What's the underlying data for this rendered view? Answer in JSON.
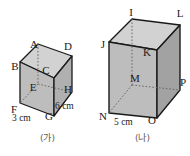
{
  "sheet": {
    "title": "two-cuboid-geometry-figure",
    "background": "#ffffff",
    "width": 190,
    "height": 156
  },
  "style": {
    "edge_color": "#1a1a1a",
    "hidden_edge_color": "#6a6a6a",
    "front_face_fill": "#bdbdbd",
    "side_face_fill": "#a6a6a6",
    "top_face_fill": "#d2d2d2",
    "label_color": "#1a1a1a",
    "caption_color": "#5a5a5a"
  },
  "figures": [
    {
      "id": "figure-a",
      "caption": "(가)",
      "vertices": [
        {
          "name": "A",
          "label": "A",
          "x": 34,
          "y": 48,
          "anchor": "middle",
          "hidden": true
        },
        {
          "name": "B",
          "label": "B",
          "x": 15,
          "y": 70,
          "anchor": "middle",
          "hidden": false
        },
        {
          "name": "C",
          "label": "C",
          "x": 46,
          "y": 74,
          "anchor": "middle",
          "hidden": false
        },
        {
          "name": "D",
          "label": "D",
          "x": 68,
          "y": 50,
          "anchor": "middle",
          "hidden": false
        },
        {
          "name": "E",
          "label": "E",
          "x": 33,
          "y": 91,
          "anchor": "middle",
          "hidden": true
        },
        {
          "name": "F",
          "label": "F",
          "x": 14,
          "y": 113,
          "anchor": "middle",
          "hidden": false
        },
        {
          "name": "G",
          "label": "G",
          "x": 49,
          "y": 120,
          "anchor": "middle",
          "hidden": false
        },
        {
          "name": "H",
          "label": "H",
          "x": 68,
          "y": 93,
          "anchor": "middle",
          "hidden": false
        }
      ],
      "dimensions": [
        {
          "name": "depth-label",
          "text": "6 cm",
          "x": 55,
          "y": 109,
          "anchor": "start"
        },
        {
          "name": "width-label",
          "text": "3 cm",
          "x": 12,
          "y": 120,
          "anchor": "start"
        }
      ]
    },
    {
      "id": "figure-b",
      "caption": "(나)",
      "vertices": [
        {
          "name": "I",
          "label": "I",
          "x": 35,
          "y": 16,
          "anchor": "middle",
          "hidden": true
        },
        {
          "name": "J",
          "label": "J",
          "x": 8,
          "y": 48,
          "anchor": "middle",
          "hidden": false
        },
        {
          "name": "K",
          "label": "K",
          "x": 52,
          "y": 54,
          "anchor": "middle",
          "hidden": false
        },
        {
          "name": "L",
          "label": "L",
          "x": 81,
          "y": 16,
          "anchor": "middle",
          "hidden": false
        },
        {
          "name": "M",
          "label": "M",
          "x": 40,
          "y": 80,
          "anchor": "middle",
          "hidden": true
        },
        {
          "name": "N",
          "label": "N",
          "x": 8,
          "y": 119,
          "anchor": "middle",
          "hidden": false
        },
        {
          "name": "O",
          "label": "O",
          "x": 56,
          "y": 122,
          "anchor": "middle",
          "hidden": false
        },
        {
          "name": "P",
          "label": "P",
          "x": 81,
          "y": 83,
          "anchor": "middle",
          "hidden": false
        }
      ],
      "dimensions": [
        {
          "name": "width-label",
          "text": "5 cm",
          "x": 19,
          "y": 124,
          "anchor": "start"
        }
      ]
    }
  ]
}
